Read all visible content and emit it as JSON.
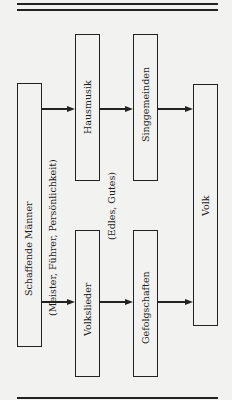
{
  "diagram": {
    "nodes": [
      {
        "id": "schaffende",
        "label": "Schaffende Männer",
        "sublabel": "(Meister, Führer, Persönlichkeit)"
      },
      {
        "id": "hausmusik",
        "label": "Hausmusik"
      },
      {
        "id": "volkslieder",
        "label": "Volkslieder"
      },
      {
        "id": "singgemeinden",
        "label": "Singgemeinden"
      },
      {
        "id": "gefolgschaften",
        "label": "Gefolgschaften"
      },
      {
        "id": "volk",
        "label": "Volk"
      }
    ],
    "middle_note": "(Edles, Gutes)",
    "edges": [
      {
        "from": "schaffende",
        "to": "hausmusik"
      },
      {
        "from": "schaffende",
        "to": "volkslieder"
      },
      {
        "from": "hausmusik",
        "to": "singgemeinden"
      },
      {
        "from": "volkslieder",
        "to": "gefolgschaften"
      },
      {
        "from": "singgemeinden",
        "to": "volk"
      },
      {
        "from": "gefolgschaften",
        "to": "volk"
      }
    ]
  }
}
